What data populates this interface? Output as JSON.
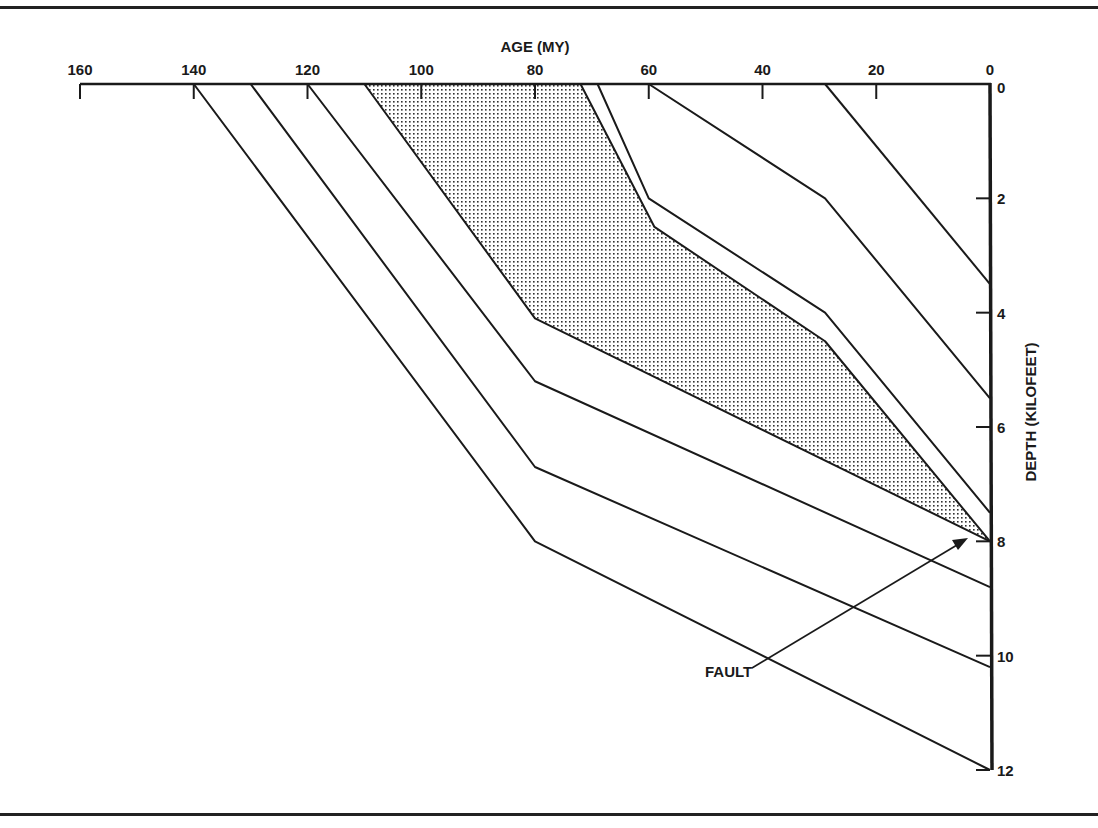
{
  "chart_data": {
    "type": "line",
    "title": "",
    "xlabel": "AGE (MY)",
    "ylabel": "DEPTH (KILOFEET)",
    "x_axis_position": "top",
    "y_axis_position": "right",
    "x_reversed": true,
    "y_reversed": true,
    "xlim": [
      160,
      0
    ],
    "ylim": [
      0,
      12
    ],
    "x_ticks": [
      "160",
      "140",
      "120",
      "100",
      "80",
      "60",
      "40",
      "20",
      "0"
    ],
    "y_ticks": [
      "0",
      "2",
      "4",
      "6",
      "8",
      "10",
      "12"
    ],
    "grid": false,
    "legend": null,
    "series": [
      {
        "name": "horizon-1",
        "points": [
          [
            140,
            0
          ],
          [
            80,
            8.0
          ],
          [
            0,
            12.0
          ]
        ]
      },
      {
        "name": "horizon-2",
        "points": [
          [
            130,
            0
          ],
          [
            80,
            6.7
          ],
          [
            0,
            10.2
          ]
        ]
      },
      {
        "name": "horizon-3",
        "points": [
          [
            120,
            0
          ],
          [
            80,
            5.2
          ],
          [
            0,
            8.8
          ]
        ]
      },
      {
        "name": "shaded-zone-lower",
        "points": [
          [
            110,
            0
          ],
          [
            80,
            4.1
          ],
          [
            0,
            8.0
          ]
        ]
      },
      {
        "name": "shaded-zone-upper",
        "points": [
          [
            72,
            0
          ],
          [
            59,
            2.5
          ],
          [
            29,
            4.5
          ],
          [
            0,
            8.0
          ]
        ]
      },
      {
        "name": "horizon-6",
        "points": [
          [
            69,
            0
          ],
          [
            60,
            2.0
          ],
          [
            29,
            4.0
          ],
          [
            0,
            7.5
          ]
        ]
      },
      {
        "name": "horizon-7",
        "points": [
          [
            60,
            0
          ],
          [
            29,
            2.0
          ],
          [
            0,
            5.5
          ]
        ]
      },
      {
        "name": "horizon-8",
        "points": [
          [
            29,
            0
          ],
          [
            0,
            3.5
          ]
        ]
      }
    ],
    "shaded_region": {
      "between": [
        "shaded-zone-lower",
        "shaded-zone-upper"
      ],
      "fill": "stippled"
    },
    "annotations": [
      {
        "text": "FAULT",
        "arrow_to": [
          0,
          8
        ]
      }
    ]
  },
  "labels": {
    "x_title": "AGE (MY)",
    "y_title": "DEPTH (KILOFEET)",
    "fault": "FAULT"
  },
  "colors": {
    "ink": "#1a1a1a",
    "background": "#ffffff"
  }
}
